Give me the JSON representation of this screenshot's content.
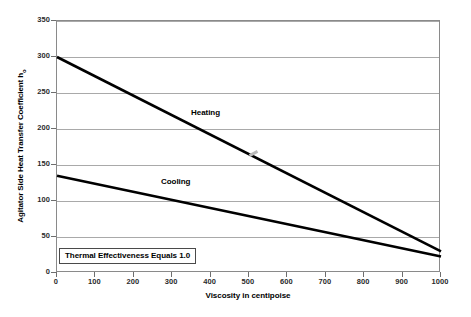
{
  "chart_data": {
    "type": "line",
    "title": "",
    "xlabel": "Viscosity in centipoise",
    "ylabel": "Agitator Side Heat Transfer Coefficient h",
    "ylabel_subscript": "o",
    "xlim": [
      0,
      1000
    ],
    "ylim": [
      0,
      350
    ],
    "xticks": [
      0,
      100,
      200,
      300,
      400,
      500,
      600,
      700,
      800,
      900,
      1000
    ],
    "yticks": [
      0,
      50,
      100,
      150,
      200,
      250,
      300,
      350
    ],
    "xtick_labels": [
      "0",
      "100",
      "200",
      "300",
      "400",
      "500",
      "600",
      "700",
      "800",
      "900",
      "1000"
    ],
    "ytick_labels": [
      "0",
      "50",
      "100",
      "150",
      "200",
      "250",
      "300",
      "350"
    ],
    "grid": "horizontal",
    "legend_position": "inline-labels",
    "series": [
      {
        "name": "Heating",
        "label": "Heating",
        "color": "#000000",
        "x": [
          0,
          1000
        ],
        "values": [
          300,
          30
        ]
      },
      {
        "name": "Cooling",
        "label": "Cooling",
        "color": "#000000",
        "x": [
          0,
          1000
        ],
        "values": [
          135,
          23
        ]
      }
    ],
    "annotations": [
      {
        "name": "thermal-effectiveness-note",
        "text": "Thermal Effectiveness Equals 1.0",
        "x": 20,
        "y": 25
      }
    ]
  },
  "colors": {
    "plot_border": "#8a8a8a",
    "gridline": "#a9a9a9",
    "series_line": "#000000",
    "text": "#000000",
    "background": "#ffffff",
    "annotation_border": "#4a4a4a",
    "marker_artifact": "#b9b9b9"
  }
}
